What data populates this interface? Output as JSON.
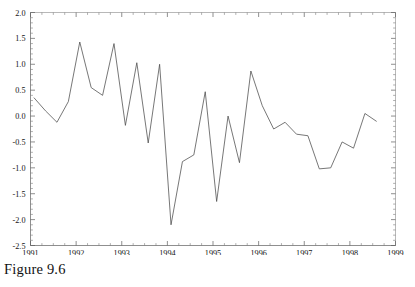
{
  "caption": "Figure 9.6",
  "chart_data": {
    "type": "line",
    "title": "",
    "xlabel": "",
    "ylabel": "",
    "xlim": [
      1991.0,
      1999.0
    ],
    "ylim": [
      -2.5,
      2.0
    ],
    "grid": false,
    "legend": "none",
    "line_color": "#4a4a4a",
    "frame_color": "#9a9a9a",
    "axis_color": "#5f5f5f",
    "x_ticks": [
      1991,
      1992,
      1993,
      1994,
      1995,
      1996,
      1997,
      1998,
      1999
    ],
    "x_tick_labels": [
      "1991",
      "1992",
      "1993",
      "1994",
      "1995",
      "1996",
      "1997",
      "1998",
      "1999"
    ],
    "x_minor_step": 0.25,
    "y_ticks": [
      2.0,
      1.5,
      1.0,
      0.5,
      0.0,
      -0.5,
      -1.0,
      -1.5,
      -2.0,
      -2.5
    ],
    "y_tick_labels": [
      "2.0",
      "1.5",
      "1.0",
      "0.5",
      "0.0",
      "-0.5",
      "-1.0",
      "-1.5",
      "-2.0",
      "-2.5"
    ],
    "y_minor_step": 0.1,
    "series": [
      {
        "name": "series-1",
        "x": [
          1991.08,
          1991.33,
          1991.58,
          1991.83,
          1992.08,
          1992.33,
          1992.58,
          1992.83,
          1993.08,
          1993.33,
          1993.58,
          1993.83,
          1994.08,
          1994.33,
          1994.58,
          1994.83,
          1995.08,
          1995.33,
          1995.58,
          1995.83,
          1996.08,
          1996.33,
          1996.58,
          1996.83,
          1997.08,
          1997.33,
          1997.58,
          1997.83,
          1998.08,
          1998.33,
          1998.58
        ],
        "y": [
          0.35,
          0.1,
          -0.12,
          0.28,
          1.43,
          0.55,
          0.4,
          1.4,
          -0.18,
          1.03,
          -0.52,
          1.0,
          -2.1,
          -0.88,
          -0.75,
          0.47,
          -1.65,
          0.0,
          -0.9,
          0.87,
          0.2,
          -0.25,
          -0.12,
          -0.35,
          -0.38,
          -1.02,
          -1.0,
          -0.5,
          -0.62,
          0.05,
          -0.1
        ]
      }
    ]
  }
}
